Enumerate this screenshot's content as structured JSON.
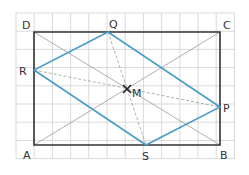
{
  "diagram": {
    "grid": {
      "x0": 16,
      "y0": 13,
      "cols": 12,
      "rows": 8,
      "cell": 18.2,
      "color": "#cfcfcf"
    },
    "rectangle": {
      "label": "ABCD",
      "color": "#333333",
      "vertices": {
        "A": [
          34,
          145
        ],
        "B": [
          220,
          145
        ],
        "C": [
          220,
          32
        ],
        "D": [
          34,
          32
        ]
      }
    },
    "rhombus": {
      "label": "PQRS",
      "color": "#4a9cc8",
      "vertices": {
        "P": [
          220,
          107
        ],
        "Q": [
          108,
          32
        ],
        "R": [
          34,
          70
        ],
        "S": [
          146,
          145
        ]
      }
    },
    "center": {
      "label": "M",
      "point": [
        127,
        89
      ]
    },
    "labels": {
      "A": "A",
      "B": "B",
      "C": "C",
      "D": "D",
      "P": "P",
      "Q": "Q",
      "R": "R",
      "S": "S",
      "M": "M"
    }
  }
}
